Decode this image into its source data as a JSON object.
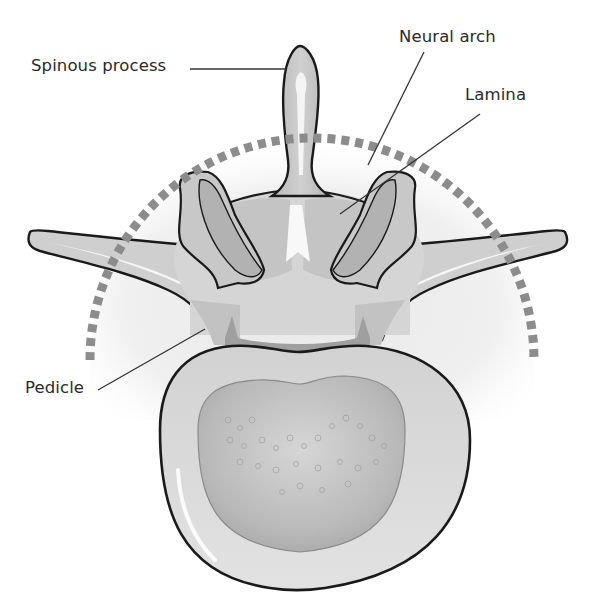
{
  "figure": {
    "labels": {
      "spinous_process": "Spinous process",
      "neural_arch": "Neural arch",
      "lamina": "Lamina",
      "pedicle": "Pedicle"
    },
    "colors": {
      "outline": "#1a1a1a",
      "bone_light": "#dcdcdc",
      "bone_mid": "#c2c2c2",
      "bone_dark": "#9e9e9e",
      "highlight": "#f7f7f7",
      "dashed_arc": "#8c8c8c",
      "leader_line": "#333333",
      "label_text": "#2a2a2a"
    }
  }
}
